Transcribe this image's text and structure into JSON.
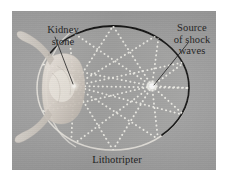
{
  "figure": {
    "plate_background_color": "#a3a3a3",
    "ink_color": "#1c1c1c",
    "dot_color": "#f2f2ee",
    "labels": {
      "kidney_stone": {
        "line1": "Kidney",
        "line2": "stone"
      },
      "source_of_shock_waves": {
        "line1": "Source",
        "line2": "of shock",
        "line3": "waves"
      },
      "lithotripter": {
        "line1": "Lithotripter"
      }
    },
    "geometry": {
      "ellipse_center_x": 113,
      "ellipse_center_y": 88,
      "ellipse_rx": 76,
      "ellipse_ry": 62,
      "focus_source_x": 152,
      "focus_source_y": 86,
      "focus_stone_x": 74,
      "focus_stone_y": 86,
      "ray_count": 9
    }
  }
}
